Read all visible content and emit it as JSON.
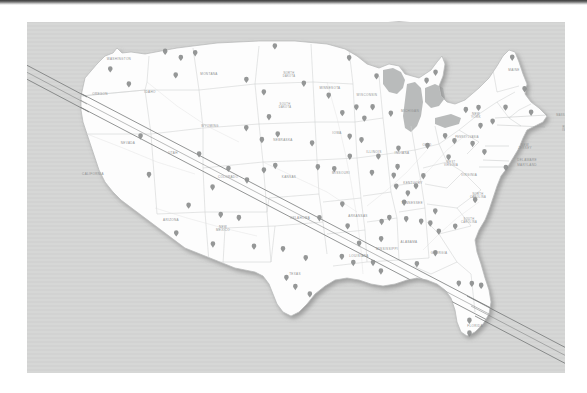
{
  "slide": {
    "background_color": "#ffffff",
    "panel_color": "#d4d5d4",
    "title": "",
    "top_strip_present": true
  },
  "map": {
    "name": "united-states-eclipse-path-map",
    "title": "",
    "land_fill": "#fdfdfd",
    "water_fill": "#b9bbbb",
    "border_color": "#c9cbcb",
    "state_label_color": "#8e9090",
    "city_marker_color": "#8c8e8e",
    "path_line_color": "#6f7272",
    "path_line_count": 3,
    "path_description": "three parallel diagonal lines crossing from northwest (Pacific Northwest) to southeast (Atlantic off Florida)",
    "state_labels": [
      {
        "name": "WASHINGTON",
        "x": 92,
        "y": 38
      },
      {
        "name": "OREGON",
        "x": 73,
        "y": 73
      },
      {
        "name": "CALIFORNIA",
        "x": 66,
        "y": 153
      },
      {
        "name": "NEVADA",
        "x": 101,
        "y": 122
      },
      {
        "name": "IDAHO",
        "x": 123,
        "y": 71
      },
      {
        "name": "MONTANA",
        "x": 182,
        "y": 53
      },
      {
        "name": "WYOMING",
        "x": 183,
        "y": 105
      },
      {
        "name": "UTAH",
        "x": 146,
        "y": 132
      },
      {
        "name": "ARIZONA",
        "x": 144,
        "y": 199
      },
      {
        "name": "COLORADO",
        "x": 201,
        "y": 156
      },
      {
        "name": "NEW MEXICO",
        "x": 196,
        "y": 206
      },
      {
        "name": "NORTH DAKOTA",
        "x": 262,
        "y": 52
      },
      {
        "name": "SOUTH DAKOTA",
        "x": 258,
        "y": 83
      },
      {
        "name": "NEBRASKA",
        "x": 256,
        "y": 119
      },
      {
        "name": "KANSAS",
        "x": 262,
        "y": 156
      },
      {
        "name": "OKLAHOMA",
        "x": 273,
        "y": 197
      },
      {
        "name": "TEXAS",
        "x": 268,
        "y": 253
      },
      {
        "name": "MINNESOTA",
        "x": 303,
        "y": 67
      },
      {
        "name": "IOWA",
        "x": 310,
        "y": 112
      },
      {
        "name": "MISSOURI",
        "x": 314,
        "y": 152
      },
      {
        "name": "ARKANSAS",
        "x": 331,
        "y": 195
      },
      {
        "name": "LOUISIANA",
        "x": 332,
        "y": 235
      },
      {
        "name": "WISCONSIN",
        "x": 340,
        "y": 74
      },
      {
        "name": "ILLINOIS",
        "x": 347,
        "y": 131
      },
      {
        "name": "MISSISSIPPI",
        "x": 360,
        "y": 228
      },
      {
        "name": "MICHIGAN",
        "x": 383,
        "y": 90
      },
      {
        "name": "INDIANA",
        "x": 375,
        "y": 132
      },
      {
        "name": "KENTUCKY",
        "x": 386,
        "y": 162
      },
      {
        "name": "TENNESSEE",
        "x": 385,
        "y": 182
      },
      {
        "name": "ALABAMA",
        "x": 382,
        "y": 221
      },
      {
        "name": "OHIO",
        "x": 400,
        "y": 124
      },
      {
        "name": "GEORGIA",
        "x": 412,
        "y": 232
      },
      {
        "name": "FLORIDA",
        "x": 448,
        "y": 305
      },
      {
        "name": "WEST VIRGINIA",
        "x": 424,
        "y": 141
      },
      {
        "name": "VIRGINIA",
        "x": 442,
        "y": 154
      },
      {
        "name": "NORTH CAROLINA",
        "x": 451,
        "y": 173
      },
      {
        "name": "SOUTH CAROLINA",
        "x": 442,
        "y": 198
      },
      {
        "name": "PENNSYLVANIA",
        "x": 440,
        "y": 116
      },
      {
        "name": "NEW YORK",
        "x": 449,
        "y": 93
      },
      {
        "name": "MAINE",
        "x": 487,
        "y": 49
      },
      {
        "name": "MASSACHUSETTS",
        "x": 543,
        "y": 94
      },
      {
        "name": "RHODE ISLAND",
        "x": 541,
        "y": 106
      },
      {
        "name": "NEW JERSEY",
        "x": 498,
        "y": 124
      },
      {
        "name": "DELAWARE",
        "x": 500,
        "y": 139
      },
      {
        "name": "MARYLAND",
        "x": 500,
        "y": 144
      }
    ]
  },
  "icons": {
    "city_marker": "map-pin-icon",
    "path_line": "eclipse-path-line-icon"
  }
}
